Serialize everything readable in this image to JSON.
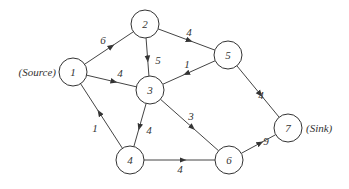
{
  "diagram": {
    "type": "directed-network",
    "colors": {
      "stroke": "#333333",
      "background": "#ffffff"
    },
    "nodes": [
      {
        "id": "1",
        "label": "1",
        "x": 73,
        "y": 72,
        "annotation": "(Source)"
      },
      {
        "id": "2",
        "label": "2",
        "x": 145,
        "y": 24
      },
      {
        "id": "3",
        "label": "3",
        "x": 150,
        "y": 90
      },
      {
        "id": "4",
        "label": "4",
        "x": 130,
        "y": 160
      },
      {
        "id": "5",
        "label": "5",
        "x": 228,
        "y": 55
      },
      {
        "id": "6",
        "label": "6",
        "x": 229,
        "y": 160
      },
      {
        "id": "7",
        "label": "7",
        "x": 288,
        "y": 128,
        "annotation": "(Sink)"
      }
    ],
    "edges": [
      {
        "from": "1",
        "to": "2",
        "weight": "6",
        "lx": 103,
        "ly": 40
      },
      {
        "from": "1",
        "to": "3",
        "weight": "4",
        "lx": 120,
        "ly": 73
      },
      {
        "from": "4",
        "to": "1",
        "weight": "1",
        "lx": 95,
        "ly": 128
      },
      {
        "from": "2",
        "to": "3",
        "weight": "5",
        "lx": 158,
        "ly": 60
      },
      {
        "from": "2",
        "to": "5",
        "weight": "4",
        "lx": 189,
        "ly": 32
      },
      {
        "from": "5",
        "to": "3",
        "weight": "1",
        "lx": 187,
        "ly": 64
      },
      {
        "from": "5",
        "to": "7",
        "weight": "4",
        "lx": 261,
        "ly": 95
      },
      {
        "from": "3",
        "to": "4",
        "weight": "4",
        "lx": 149,
        "ly": 130
      },
      {
        "from": "3",
        "to": "6",
        "weight": "3",
        "lx": 191,
        "ly": 116
      },
      {
        "from": "4",
        "to": "6",
        "weight": "4",
        "lx": 180,
        "ly": 169
      },
      {
        "from": "6",
        "to": "7",
        "weight": "9",
        "lx": 266,
        "ly": 141
      }
    ],
    "annotations": {
      "source": "(Source)",
      "sink": "(Sink)"
    }
  }
}
